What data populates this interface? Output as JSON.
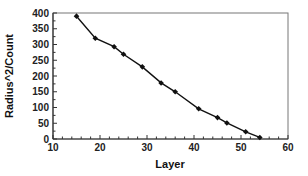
{
  "chart_data": {
    "type": "line",
    "title": "",
    "xlabel": "Layer",
    "ylabel": "Radius^2/Count",
    "xlim": [
      10,
      60
    ],
    "ylim": [
      0,
      400
    ],
    "xticks": [
      10,
      20,
      30,
      40,
      50,
      60
    ],
    "yticks": [
      0,
      50,
      100,
      150,
      200,
      250,
      300,
      350,
      400
    ],
    "grid": false,
    "legend": null,
    "series": [
      {
        "name": "Radius^2/Count",
        "color": "#111111",
        "marker": "diamond",
        "x": [
          15,
          19,
          23,
          25,
          29,
          33,
          36,
          41,
          45,
          47,
          51,
          54
        ],
        "y": [
          390,
          320,
          293,
          269,
          229,
          178,
          150,
          96,
          68,
          51,
          23,
          5
        ]
      }
    ]
  }
}
